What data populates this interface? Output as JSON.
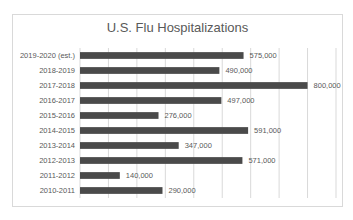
{
  "chart_data": {
    "type": "bar",
    "orientation": "horizontal",
    "title": "U.S. Flu Hospitalizations",
    "xlabel": "",
    "ylabel": "",
    "categories": [
      "2019-2020 (est.)",
      "2018-2019",
      "2017-2018",
      "2016-2017",
      "2015-2016",
      "2014-2015",
      "2013-2014",
      "2012-2013",
      "2011-2012",
      "2010-2011"
    ],
    "values": [
      575000,
      490000,
      800000,
      497000,
      276000,
      591000,
      347000,
      571000,
      140000,
      290000
    ],
    "data_labels": [
      "575,000",
      "490,000",
      "800,000",
      "497,000",
      "276,000",
      "591,000",
      "347,000",
      "571,000",
      "140,000",
      "290,000"
    ],
    "xlim": [
      0,
      900000
    ],
    "gridlines": true,
    "grid_step": 100000,
    "x_tick_labels_shown": false,
    "legend": "none",
    "bar_color": "#4a4a4a"
  }
}
